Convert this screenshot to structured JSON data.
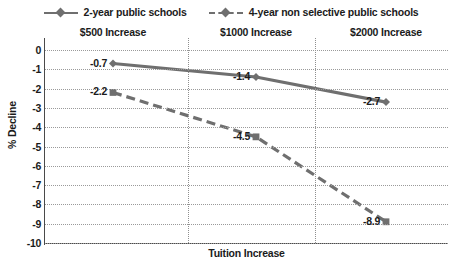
{
  "chart_data": {
    "type": "line",
    "title": "",
    "xlabel": "Tuition Increase",
    "ylabel": "% Decline",
    "categories": [
      "$500 Increase",
      "$1000 Increase",
      "$2000 Increase"
    ],
    "ylim": [
      -10,
      0
    ],
    "y_ticks": [
      "0",
      "-1",
      "-2",
      "-3",
      "-4",
      "-5",
      "-6",
      "-7",
      "-8",
      "-9",
      "-10"
    ],
    "y_tick_values": [
      0,
      -1,
      -2,
      -3,
      -4,
      -5,
      -6,
      -7,
      -8,
      -9,
      -10
    ],
    "grid": true,
    "legend_position": "top",
    "series": [
      {
        "name": "2-year public schools",
        "values": [
          -0.7,
          -1.4,
          -2.7
        ],
        "labels": [
          "-0.7",
          "-1.4",
          "-2.7"
        ],
        "style": "solid",
        "marker": "diamond",
        "color": "#6f6f6f"
      },
      {
        "name": "4-year non selective public schools",
        "values": [
          -2.2,
          -4.5,
          -8.9
        ],
        "labels": [
          "-2.2",
          "-4.5",
          "-8.9"
        ],
        "style": "dashed",
        "marker": "square",
        "color": "#6f6f6f"
      }
    ]
  },
  "legend": {
    "items": [
      {
        "label": "2-year public schools"
      },
      {
        "label": "4-year non selective public schools"
      }
    ]
  },
  "axes": {
    "y_title": "% Decline",
    "x_title": "Tuition Increase"
  },
  "colors": {
    "line": "#6f6f6f",
    "axis": "#4a4a4a",
    "grid": "#9a9a9a",
    "text": "#1b1b1b",
    "background": "#ffffff"
  }
}
